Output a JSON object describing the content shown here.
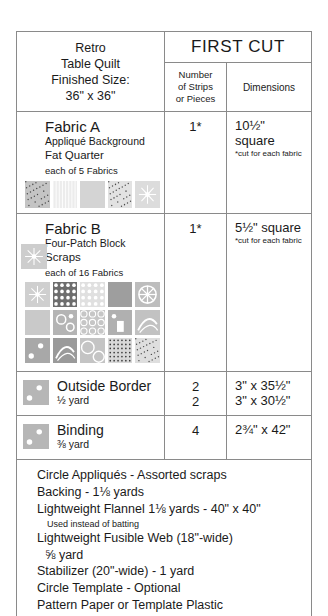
{
  "chart_data": {
    "type": "table",
    "title": "Retro Table Quilt",
    "subtitle": "Finished Size: 36\" x 36\"",
    "columns": [
      "Fabric",
      "Number of Strips or Pieces",
      "Dimensions"
    ],
    "rows": [
      {
        "fabric": "Fabric A",
        "pieces": "1*",
        "dimensions": "10½\" square"
      },
      {
        "fabric": "Fabric B",
        "pieces": "1*",
        "dimensions": "5½\" square"
      },
      {
        "fabric": "Outside Border",
        "pieces": "2",
        "dimensions": "3\" x 35½\""
      },
      {
        "fabric": "Outside Border",
        "pieces": "2",
        "dimensions": "3\" x 30½\""
      },
      {
        "fabric": "Binding",
        "pieces": "4",
        "dimensions": "2¾\" x 42\""
      }
    ]
  },
  "header": {
    "title_line1": "Retro",
    "title_line2": "Table Quilt",
    "title_line3": "Finished Size:",
    "title_line4": "36\" x 36\"",
    "first_cut": "FIRST CUT",
    "col_number_line1": "Number",
    "col_number_line2": "of Strips",
    "col_number_line3": "or Pieces",
    "col_dimensions": "Dimensions"
  },
  "rows": {
    "fabric_a": {
      "name": "Fabric A",
      "desc1": "Appliqué Background",
      "desc2": "Fat Quarter",
      "count": "each of 5 Fabrics",
      "pieces": "1*",
      "dimensions": "10½\" square",
      "dim_note": "*cut for each fabric",
      "swatch_count": 5
    },
    "fabric_b": {
      "name": "Fabric B",
      "desc1": "Four-Patch Block",
      "desc2": "Scraps",
      "count": "each of 16 Fabrics",
      "pieces": "1*",
      "dimensions": "5½\" square",
      "dim_note": "*cut for each fabric",
      "swatch_count": 16
    },
    "outside_border": {
      "name": "Outside Border",
      "yardage": "½  yard",
      "pieces_line1": "2",
      "pieces_line2": "2",
      "dimensions_line1": "3\" x 35½\"",
      "dimensions_line2": "3\" x 30½\""
    },
    "binding": {
      "name": "Binding",
      "yardage": "⅜  yard",
      "pieces": "4",
      "dimensions": "2¾\" x 42\""
    }
  },
  "notes": {
    "line1": "Circle Appliqués - Assorted scraps",
    "line2": "Backing - 1⅛  yards",
    "line3": "Lightweight Flannel 1⅛  yards - 40\" x 40\"",
    "line3_sub": "Used instead of batting",
    "line4": "Lightweight Fusible Web (18\"-wide)",
    "line4_sub": "⅝  yard",
    "line5": "Stabilizer (20\"-wide) - 1 yard",
    "line6": "Circle Template - Optional",
    "line7": "Pattern Paper or Template Plastic",
    "line8": "Embroidery Floss (2 colors)"
  },
  "colors": {
    "border": "#8a8a8a",
    "swatch_base": "#c8c8c8",
    "text": "#1a1a1a"
  }
}
